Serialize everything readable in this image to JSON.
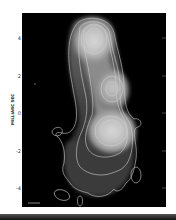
{
  "figure": {
    "type": "radio-map",
    "y_axis": {
      "label": "MILLIARC SEC",
      "ticks": [
        "4",
        "2",
        "0",
        "-2",
        "-4"
      ]
    },
    "colors": {
      "background": "#000000",
      "contour": "#cfcfcf",
      "frame": "#ffffff"
    }
  }
}
